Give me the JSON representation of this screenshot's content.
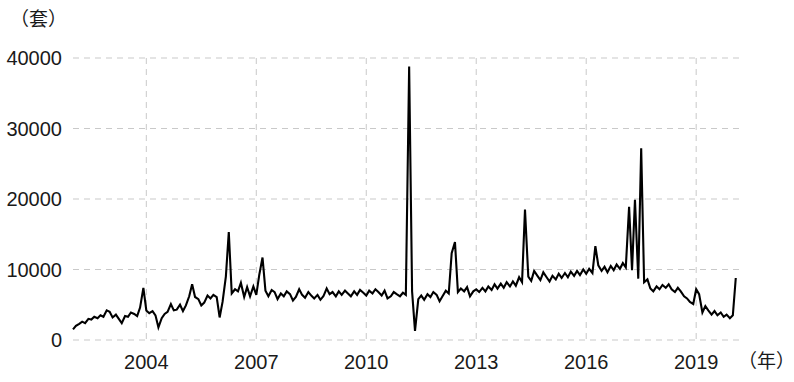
{
  "chart_data": {
    "type": "line",
    "title": "",
    "subtitle": "",
    "xlabel": "（年）",
    "ylabel": "（套）",
    "y_unit_label": "（套）",
    "x_unit_label": "（年）",
    "xlim": [
      2002.0,
      2020.25
    ],
    "ylim": [
      0,
      40000
    ],
    "y_ticks": [
      0,
      10000,
      20000,
      30000,
      40000
    ],
    "y_tick_labels": [
      "0",
      "10000",
      "20000",
      "30000",
      "40000"
    ],
    "x_ticks": [
      2004,
      2007,
      2010,
      2013,
      2016,
      2019
    ],
    "x_tick_labels": [
      "2004",
      "2007",
      "2010",
      "2013",
      "2016",
      "2019"
    ],
    "grid": {
      "horizontal": true,
      "vertical": true,
      "style": "dashed",
      "color": "#c9c9c9"
    },
    "legend": {
      "show": false,
      "position": "none"
    },
    "series": [
      {
        "name": "商品房成交套数",
        "color": "#000000",
        "x": [
          2002.0,
          2002.08,
          2002.17,
          2002.25,
          2002.33,
          2002.42,
          2002.5,
          2002.58,
          2002.67,
          2002.75,
          2002.83,
          2002.92,
          2003.0,
          2003.08,
          2003.17,
          2003.25,
          2003.33,
          2003.42,
          2003.5,
          2003.58,
          2003.67,
          2003.75,
          2003.83,
          2003.92,
          2004.0,
          2004.08,
          2004.17,
          2004.25,
          2004.33,
          2004.42,
          2004.5,
          2004.58,
          2004.67,
          2004.75,
          2004.83,
          2004.92,
          2005.0,
          2005.08,
          2005.17,
          2005.25,
          2005.33,
          2005.42,
          2005.5,
          2005.58,
          2005.67,
          2005.75,
          2005.83,
          2005.92,
          2006.0,
          2006.08,
          2006.17,
          2006.25,
          2006.33,
          2006.42,
          2006.5,
          2006.58,
          2006.67,
          2006.75,
          2006.83,
          2006.92,
          2007.0,
          2007.08,
          2007.17,
          2007.25,
          2007.33,
          2007.42,
          2007.5,
          2007.58,
          2007.67,
          2007.75,
          2007.83,
          2007.92,
          2008.0,
          2008.08,
          2008.17,
          2008.25,
          2008.33,
          2008.42,
          2008.5,
          2008.58,
          2008.67,
          2008.75,
          2008.83,
          2008.92,
          2009.0,
          2009.08,
          2009.17,
          2009.25,
          2009.33,
          2009.42,
          2009.5,
          2009.58,
          2009.67,
          2009.75,
          2009.83,
          2009.92,
          2010.0,
          2010.08,
          2010.17,
          2010.25,
          2010.33,
          2010.42,
          2010.5,
          2010.58,
          2010.67,
          2010.75,
          2010.83,
          2010.92,
          2011.0,
          2011.08,
          2011.17,
          2011.25,
          2011.33,
          2011.42,
          2011.5,
          2011.58,
          2011.67,
          2011.75,
          2011.83,
          2011.92,
          2012.0,
          2012.08,
          2012.17,
          2012.25,
          2012.33,
          2012.42,
          2012.5,
          2012.58,
          2012.67,
          2012.75,
          2012.83,
          2012.92,
          2013.0,
          2013.08,
          2013.17,
          2013.25,
          2013.33,
          2013.42,
          2013.5,
          2013.58,
          2013.67,
          2013.75,
          2013.83,
          2013.92,
          2014.0,
          2014.08,
          2014.17,
          2014.25,
          2014.33,
          2014.42,
          2014.5,
          2014.58,
          2014.67,
          2014.75,
          2014.83,
          2014.92,
          2015.0,
          2015.08,
          2015.17,
          2015.25,
          2015.33,
          2015.42,
          2015.5,
          2015.58,
          2015.67,
          2015.75,
          2015.83,
          2015.92,
          2016.0,
          2016.08,
          2016.17,
          2016.25,
          2016.33,
          2016.42,
          2016.5,
          2016.58,
          2016.67,
          2016.75,
          2016.83,
          2016.92,
          2017.0,
          2017.08,
          2017.17,
          2017.25,
          2017.33,
          2017.42,
          2017.5,
          2017.58,
          2017.67,
          2017.75,
          2017.83,
          2017.92,
          2018.0,
          2018.08,
          2018.17,
          2018.25,
          2018.33,
          2018.42,
          2018.5,
          2018.58,
          2018.67,
          2018.75,
          2018.83,
          2018.92,
          2019.0,
          2019.08,
          2019.17,
          2019.25,
          2019.33,
          2019.42,
          2019.5,
          2019.58,
          2019.67,
          2019.75,
          2019.83,
          2019.92,
          2020.0,
          2020.08
        ],
        "values": [
          1500,
          2000,
          2300,
          2600,
          2400,
          3000,
          2900,
          3300,
          3100,
          3500,
          3300,
          4200,
          4000,
          3200,
          3600,
          3000,
          2400,
          3400,
          3300,
          3900,
          3700,
          3400,
          4600,
          7400,
          4200,
          3800,
          4100,
          3500,
          1800,
          3100,
          3700,
          4000,
          5100,
          4200,
          4300,
          5000,
          4100,
          4900,
          6200,
          7900,
          6100,
          5800,
          4900,
          5300,
          6300,
          5900,
          6400,
          6100,
          3200,
          5400,
          9000,
          15300,
          6600,
          7200,
          6900,
          8100,
          6100,
          7500,
          6200,
          7600,
          6400,
          9200,
          11700,
          7000,
          6200,
          7100,
          6800,
          5800,
          6600,
          6200,
          6900,
          6500,
          5600,
          6100,
          7200,
          6400,
          6000,
          6800,
          6300,
          5900,
          6400,
          5700,
          6200,
          7300,
          6500,
          6800,
          6200,
          6900,
          6400,
          7000,
          6600,
          6200,
          6900,
          6400,
          7100,
          6700,
          6300,
          7000,
          6600,
          7200,
          6800,
          6300,
          7000,
          5900,
          6200,
          6800,
          6500,
          6200,
          6700,
          6400,
          38800,
          6900,
          1300,
          5800,
          6300,
          5700,
          6500,
          6100,
          6800,
          6400,
          5500,
          6200,
          7000,
          6600,
          12300,
          13900,
          6800,
          7300,
          6900,
          7500,
          6200,
          6900,
          7200,
          6800,
          7400,
          6900,
          7600,
          7100,
          7900,
          7300,
          8000,
          7400,
          8200,
          7600,
          8300,
          7700,
          8900,
          8200,
          18500,
          9000,
          8400,
          9800,
          9100,
          8500,
          9600,
          8900,
          8300,
          9100,
          8600,
          9400,
          8800,
          9500,
          8900,
          9700,
          9100,
          9800,
          9200,
          10000,
          9400,
          10100,
          9500,
          13300,
          10600,
          9800,
          10400,
          9600,
          10500,
          9900,
          10700,
          10100,
          10900,
          10300,
          18900,
          9900,
          19900,
          8700,
          27200,
          8200,
          8600,
          7300,
          6900,
          7600,
          7200,
          7800,
          7400,
          7900,
          7200,
          6800,
          7400,
          6900,
          6200,
          5900,
          5400,
          5100,
          7200,
          6500,
          3900,
          4800,
          4200,
          3600,
          4100,
          3500,
          3900,
          3300,
          3600,
          3100,
          3500,
          8800
        ]
      }
    ]
  },
  "axes": {
    "y_unit": "（套）",
    "x_unit": "（年）"
  }
}
